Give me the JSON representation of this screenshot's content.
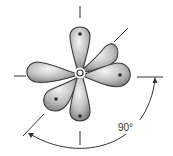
{
  "diagram": {
    "center": {
      "x": 80,
      "y": 73
    },
    "lobes": [
      {
        "name": "lobe-top",
        "angle": -90,
        "length": 46,
        "width": 14
      },
      {
        "name": "lobe-upper-right",
        "angle": -45,
        "length": 44,
        "width": 14
      },
      {
        "name": "lobe-right",
        "angle": 10,
        "length": 46,
        "width": 14
      },
      {
        "name": "lobe-bottom",
        "angle": 92,
        "length": 46,
        "width": 14
      },
      {
        "name": "lobe-lower-left",
        "angle": 135,
        "length": 44,
        "width": 14
      },
      {
        "name": "lobe-left",
        "angle": 185,
        "length": 46,
        "width": 14
      }
    ],
    "angle_label": "90°",
    "colors": {
      "lobe_light": "#f2f2f2",
      "lobe_dark": "#7a7a7a",
      "outline": "#3a3a3a",
      "line": "#333333",
      "dot": "#2a2a2a"
    }
  }
}
